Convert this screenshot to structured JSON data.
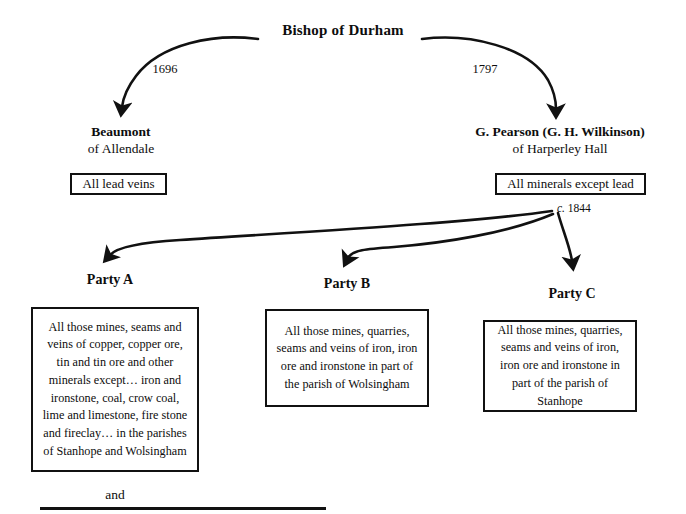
{
  "diagram": {
    "root": {
      "label": "Bishop of Durham"
    },
    "grants": [
      {
        "id": "grant-1696",
        "year": "1696"
      },
      {
        "id": "grant-1797",
        "year": "1797"
      }
    ],
    "heirs": [
      {
        "id": "beaumont",
        "name": "Beaumont",
        "seat": "of Allendale",
        "rights": "All lead veins"
      },
      {
        "id": "pearson",
        "name": "G. Pearson (G. H. Wilkinson)",
        "seat": "of Harperley Hall",
        "rights": "All minerals except lead"
      }
    ],
    "split": {
      "prefix": "c.",
      "year": "1844",
      "full": "c. 1844"
    },
    "parties": [
      {
        "id": "party-a",
        "label": "Party A",
        "clause": "All those mines, seams and veins of copper, copper ore, tin and tin ore and other minerals except… iron and ironstone, coal, crow coal, lime and limestone, fire stone and fireclay… in the parishes of Stanhope and Wolsingham"
      },
      {
        "id": "party-b",
        "label": "Party B",
        "clause": "All those mines, quarries, seams and veins of iron, iron ore and ironstone in part of the parish of Wolsingham"
      },
      {
        "id": "party-c",
        "label": "Party C",
        "clause": "All those mines, quarries, seams and veins of iron, iron ore and ironstone in part of the parish of Stanhope"
      }
    ],
    "conjunction": "and",
    "colors": {
      "ink": "#111111",
      "background": "#ffffff"
    }
  }
}
